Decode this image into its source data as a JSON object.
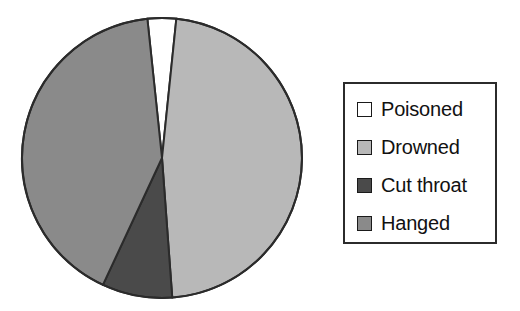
{
  "chart_data": {
    "type": "pie",
    "title": "",
    "categories": [
      "Poisoned",
      "Drowned",
      "Cut throat",
      "Hanged"
    ],
    "values": [
      3.3,
      47.2,
      8.1,
      41.4
    ],
    "value_unit": "percent",
    "start_angle_deg": -6,
    "direction": "clockwise",
    "colors": [
      "#ffffff",
      "#b8b8b8",
      "#4a4a4a",
      "#8a8a8a"
    ],
    "slice_border_color": "#2b2b2b",
    "legend_position": "right",
    "legend_border_color": "#2b2b2b",
    "grid": false,
    "xlabel": "",
    "ylabel": "",
    "slices": [
      {
        "label": "Poisoned",
        "value": 3.3,
        "color": "#ffffff",
        "angle_deg": 11.9
      },
      {
        "label": "Drowned",
        "value": 47.2,
        "color": "#b8b8b8",
        "angle_deg": 169.9
      },
      {
        "label": "Cut throat",
        "value": 8.1,
        "color": "#4a4a4a",
        "angle_deg": 29.2
      },
      {
        "label": "Hanged",
        "value": 41.4,
        "color": "#8a8a8a",
        "angle_deg": 149.0
      }
    ]
  },
  "pie": {
    "center_x": 162,
    "center_y": 158,
    "radius": 140
  },
  "legend": {
    "items": [
      {
        "label": "Poisoned",
        "swatch": "#ffffff"
      },
      {
        "label": "Drowned",
        "swatch": "#b8b8b8"
      },
      {
        "label": "Cut throat",
        "swatch": "#4a4a4a"
      },
      {
        "label": "Hanged",
        "swatch": "#8a8a8a"
      }
    ]
  }
}
